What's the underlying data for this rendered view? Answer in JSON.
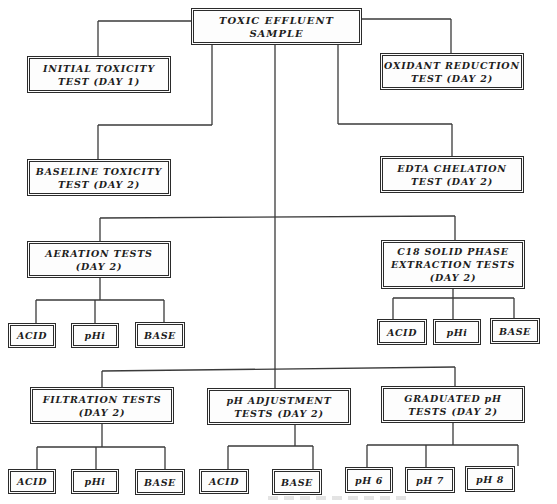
{
  "diagram": {
    "type": "flowchart-tree",
    "root": {
      "id": "root",
      "label": "TOXIC EFFLUENT SAMPLE"
    },
    "nodes": [
      {
        "id": "initial",
        "label": "INITIAL  TOXICITY\nTEST (DAY 1)",
        "parent": "root"
      },
      {
        "id": "oxidant",
        "label": "OXIDANT REDUCTION\nTEST (DAY 2)",
        "parent": "root"
      },
      {
        "id": "baseline",
        "label": "BASELINE TOXICITY\nTEST (DAY 2)",
        "parent": "root"
      },
      {
        "id": "edta",
        "label": "EDTA CHELATION\nTEST (DAY 2)",
        "parent": "root"
      },
      {
        "id": "aeration",
        "label": "AERATION TESTS\n(DAY 2)",
        "parent": "root"
      },
      {
        "id": "c18",
        "label": "C18 SOLID PHASE\nEXTRACTION TESTS\n(DAY 2)",
        "parent": "root"
      },
      {
        "id": "aer_acid",
        "label": "ACID",
        "parent": "aeration"
      },
      {
        "id": "aer_phi",
        "label": "pHi",
        "parent": "aeration"
      },
      {
        "id": "aer_base",
        "label": "BASE",
        "parent": "aeration"
      },
      {
        "id": "c18_acid",
        "label": "ACID",
        "parent": "c18"
      },
      {
        "id": "c18_phi",
        "label": "pHi",
        "parent": "c18"
      },
      {
        "id": "c18_base",
        "label": "BASE",
        "parent": "c18"
      },
      {
        "id": "filtration",
        "label": "FILTRATION TESTS\n(DAY 2)",
        "parent": "root"
      },
      {
        "id": "phadj",
        "label": "pH ADJUSTMENT\nTESTS (DAY 2)",
        "parent": "root"
      },
      {
        "id": "graduated",
        "label": "GRADUATED pH\nTESTS (DAY 2)",
        "parent": "root"
      },
      {
        "id": "fil_acid",
        "label": "ACID",
        "parent": "filtration"
      },
      {
        "id": "fil_phi",
        "label": "pHi",
        "parent": "filtration"
      },
      {
        "id": "fil_base",
        "label": "BASE",
        "parent": "filtration"
      },
      {
        "id": "adj_acid",
        "label": "ACID",
        "parent": "phadj"
      },
      {
        "id": "adj_base",
        "label": "BASE",
        "parent": "phadj"
      },
      {
        "id": "ph6",
        "label": "pH 6",
        "parent": "graduated"
      },
      {
        "id": "ph7",
        "label": "pH 7",
        "parent": "graduated"
      },
      {
        "id": "ph8",
        "label": "pH 8",
        "parent": "graduated"
      }
    ],
    "colors": {
      "line": "#3a3a3a",
      "text": "#1e1e1e",
      "background": "#ffffff"
    }
  }
}
